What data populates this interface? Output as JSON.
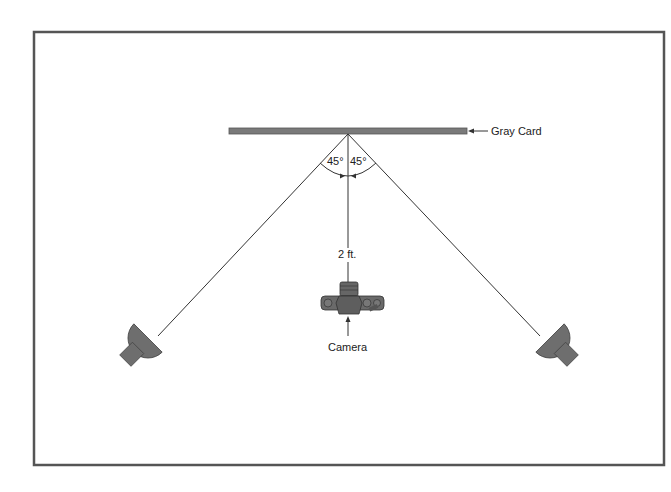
{
  "diagram": {
    "labels": {
      "gray_card": "Gray Card",
      "angle_left": "45°",
      "angle_right": "45°",
      "distance": "2 ft.",
      "camera": "Camera"
    },
    "colors": {
      "frame": "#555555",
      "card": "#7a7a7a",
      "lamp": "#707070",
      "line": "#333333"
    },
    "elements": [
      "gray-card",
      "left-lamp",
      "right-lamp",
      "camera",
      "frame"
    ]
  }
}
